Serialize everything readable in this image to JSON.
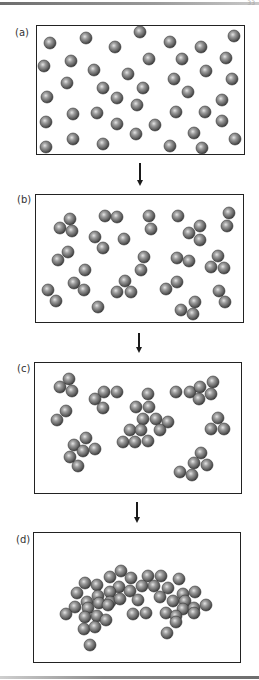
{
  "figure": {
    "page_number": "33",
    "particle_radius": 6,
    "particle_colors": {
      "highlight": "#d9d9d9",
      "mid": "#8a8a8a",
      "edge": "#3d3d3d"
    },
    "arrow_color": "#1a1a1a",
    "panels": [
      {
        "id": "a",
        "label": "(a)",
        "label_pos": [
          15,
          37
        ],
        "box": [
          36,
          25,
          209,
          130
        ],
        "particles": [
          [
            50,
            43
          ],
          [
            86,
            38
          ],
          [
            115,
            47
          ],
          [
            140,
            32
          ],
          [
            170,
            42
          ],
          [
            201,
            47
          ],
          [
            234,
            36
          ],
          [
            44,
            66
          ],
          [
            71,
            61
          ],
          [
            94,
            70
          ],
          [
            128,
            74
          ],
          [
            149,
            59
          ],
          [
            182,
            59
          ],
          [
            206,
            71
          ],
          [
            226,
            58
          ],
          [
            67,
            83
          ],
          [
            103,
            88
          ],
          [
            143,
            88
          ],
          [
            174,
            79
          ],
          [
            232,
            79
          ],
          [
            47,
            97
          ],
          [
            117,
            98
          ],
          [
            188,
            92
          ],
          [
            222,
            100
          ],
          [
            137,
            105
          ],
          [
            73,
            114
          ],
          [
            97,
            113
          ],
          [
            176,
            112
          ],
          [
            205,
            112
          ],
          [
            222,
            121
          ],
          [
            46,
            122
          ],
          [
            117,
            124
          ],
          [
            155,
            125
          ],
          [
            136,
            134
          ],
          [
            194,
            133
          ],
          [
            73,
            139
          ],
          [
            103,
            144
          ],
          [
            170,
            146
          ],
          [
            202,
            148
          ],
          [
            235,
            139
          ],
          [
            46,
            147
          ]
        ]
      },
      {
        "id": "b",
        "label": "(b)",
        "label_pos": [
          17,
          204
        ],
        "box": [
          35,
          194,
          209,
          129
        ],
        "particles": [
          [
            70,
            219
          ],
          [
            60,
            228
          ],
          [
            72,
            231
          ],
          [
            105,
            216
          ],
          [
            117,
            217
          ],
          [
            149,
            216
          ],
          [
            151,
            229
          ],
          [
            178,
            216
          ],
          [
            200,
            226
          ],
          [
            189,
            233
          ],
          [
            200,
            240
          ],
          [
            229,
            213
          ],
          [
            227,
            226
          ],
          [
            95,
            237
          ],
          [
            103,
            248
          ],
          [
            124,
            239
          ],
          [
            68,
            252
          ],
          [
            58,
            260
          ],
          [
            144,
            257
          ],
          [
            141,
            270
          ],
          [
            177,
            258
          ],
          [
            189,
            261
          ],
          [
            218,
            256
          ],
          [
            211,
            267
          ],
          [
            224,
            268
          ],
          [
            85,
            270
          ],
          [
            74,
            283
          ],
          [
            84,
            290
          ],
          [
            125,
            281
          ],
          [
            117,
            292
          ],
          [
            131,
            292
          ],
          [
            177,
            282
          ],
          [
            166,
            289
          ],
          [
            48,
            290
          ],
          [
            56,
            301
          ],
          [
            98,
            307
          ],
          [
            219,
            291
          ],
          [
            225,
            302
          ],
          [
            195,
            302
          ],
          [
            181,
            310
          ],
          [
            193,
            314
          ]
        ]
      },
      {
        "id": "c",
        "label": "(c)",
        "label_pos": [
          17,
          373
        ],
        "box": [
          34,
          362,
          208,
          132
        ],
        "particles": [
          [
            69,
            379
          ],
          [
            60,
            387
          ],
          [
            72,
            391
          ],
          [
            104,
            392
          ],
          [
            117,
            392
          ],
          [
            95,
            399
          ],
          [
            103,
            408
          ],
          [
            148,
            394
          ],
          [
            136,
            407
          ],
          [
            149,
            407
          ],
          [
            143,
            419
          ],
          [
            156,
            419
          ],
          [
            168,
            422
          ],
          [
            130,
            430
          ],
          [
            141,
            430
          ],
          [
            160,
            430
          ],
          [
            123,
            442
          ],
          [
            135,
            442
          ],
          [
            148,
            441
          ],
          [
            66,
            411
          ],
          [
            57,
            420
          ],
          [
            176,
            392
          ],
          [
            190,
            392
          ],
          [
            200,
            387
          ],
          [
            213,
            382
          ],
          [
            211,
            394
          ],
          [
            199,
            399
          ],
          [
            218,
            418
          ],
          [
            211,
            429
          ],
          [
            224,
            429
          ],
          [
            86,
            438
          ],
          [
            74,
            445
          ],
          [
            83,
            451
          ],
          [
            95,
            449
          ],
          [
            70,
            457
          ],
          [
            78,
            466
          ],
          [
            201,
            453
          ],
          [
            194,
            463
          ],
          [
            207,
            465
          ],
          [
            180,
            472
          ],
          [
            192,
            475
          ]
        ]
      },
      {
        "id": "d",
        "label": "(d)",
        "label_pos": [
          16,
          544
        ],
        "box": [
          33,
          532,
          208,
          131
        ],
        "particles": [
          [
            121,
            571
          ],
          [
            110,
            577
          ],
          [
            131,
            578
          ],
          [
            148,
            576
          ],
          [
            161,
            576
          ],
          [
            85,
            583
          ],
          [
            97,
            585
          ],
          [
            119,
            587
          ],
          [
            142,
            586
          ],
          [
            154,
            586
          ],
          [
            179,
            579
          ],
          [
            77,
            593
          ],
          [
            98,
            596
          ],
          [
            110,
            592
          ],
          [
            130,
            591
          ],
          [
            168,
            588
          ],
          [
            183,
            594
          ],
          [
            195,
            592
          ],
          [
            87,
            602
          ],
          [
            99,
            603
          ],
          [
            110,
            602
          ],
          [
            120,
            599
          ],
          [
            138,
            600
          ],
          [
            160,
            597
          ],
          [
            173,
            601
          ],
          [
            185,
            601
          ],
          [
            75,
            607
          ],
          [
            88,
            608
          ],
          [
            108,
            605
          ],
          [
            183,
            609
          ],
          [
            194,
            608
          ],
          [
            206,
            605
          ],
          [
            66,
            614
          ],
          [
            85,
            617
          ],
          [
            97,
            616
          ],
          [
            106,
            620
          ],
          [
            133,
            614
          ],
          [
            146,
            613
          ],
          [
            166,
            613
          ],
          [
            176,
            616
          ],
          [
            194,
            613
          ],
          [
            84,
            629
          ],
          [
            95,
            627
          ],
          [
            176,
            622
          ],
          [
            167,
            633
          ],
          [
            90,
            645
          ]
        ]
      }
    ],
    "arrows": [
      {
        "x": 140,
        "y1": 163,
        "y2": 186
      },
      {
        "x": 139,
        "y1": 333,
        "y2": 353
      },
      {
        "x": 137,
        "y1": 502,
        "y2": 523
      }
    ]
  }
}
